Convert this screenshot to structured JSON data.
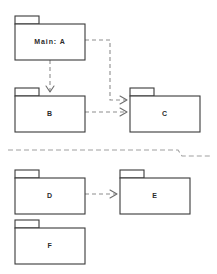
{
  "diagram": {
    "kind": "uml-package-diagram",
    "canvas": {
      "width": 217,
      "height": 274,
      "background": "#ffffff"
    },
    "colors": {
      "package_border": "#3a3a3a",
      "package_fill": "#ffffff",
      "label_text": "#2b2b2b",
      "dependency_line": "#8e8e8e",
      "arrow_head": "#6e6e6e",
      "separator_line": "#a0a0a0"
    },
    "packages": [
      {
        "id": "A",
        "label": "Main: A",
        "x": 15,
        "y": 24,
        "width": 70,
        "height": 36,
        "tab": {
          "x": 15,
          "y": 16,
          "width": 24,
          "height": 8
        },
        "label_x": 50,
        "label_y": 42
      },
      {
        "id": "B",
        "label": "B",
        "x": 15,
        "y": 96,
        "width": 70,
        "height": 36,
        "tab": {
          "x": 15,
          "y": 88,
          "width": 24,
          "height": 8
        },
        "label_x": 50,
        "label_y": 114
      },
      {
        "id": "C",
        "label": "C",
        "x": 130,
        "y": 96,
        "width": 70,
        "height": 36,
        "tab": {
          "x": 130,
          "y": 88,
          "width": 24,
          "height": 8
        },
        "label_x": 165,
        "label_y": 114
      },
      {
        "id": "D",
        "label": "D",
        "x": 15,
        "y": 178,
        "width": 70,
        "height": 36,
        "tab": {
          "x": 15,
          "y": 170,
          "width": 24,
          "height": 8
        },
        "label_x": 50,
        "label_y": 196
      },
      {
        "id": "E",
        "label": "E",
        "x": 120,
        "y": 178,
        "width": 70,
        "height": 36,
        "tab": {
          "x": 120,
          "y": 170,
          "width": 24,
          "height": 8
        },
        "label_x": 155,
        "label_y": 196
      },
      {
        "id": "F",
        "label": "F",
        "x": 15,
        "y": 228,
        "width": 70,
        "height": 36,
        "tab": {
          "x": 15,
          "y": 220,
          "width": 24,
          "height": 8
        },
        "label_x": 50,
        "label_y": 246
      }
    ],
    "dependencies": [
      {
        "id": "a-to-b",
        "from": "A",
        "to": "B",
        "style": "dashed",
        "path": "M 50 60 L 50 92",
        "arrow": "M 46 86 L 50 92 L 54 86"
      },
      {
        "id": "a-to-c",
        "from": "A",
        "to": "C",
        "style": "dashed",
        "path": "M 85 40 L 110 40 L 110 100 L 126 100",
        "arrow": "M 120 96 L 127 100 L 120 104"
      },
      {
        "id": "b-to-c",
        "from": "B",
        "to": "C",
        "style": "dashed",
        "path": "M 85 112 L 126 112",
        "arrow": "M 120 108 L 127 112 L 120 116"
      },
      {
        "id": "d-to-e",
        "from": "D",
        "to": "E",
        "style": "dashed",
        "path": "M 85 194 L 116 194",
        "arrow": "M 110 190 L 117 194 L 110 198"
      }
    ],
    "separators": [
      {
        "id": "horizontal-separator",
        "style": "dashed",
        "path": "M 8 150 L 178 150 L 182 156 L 210 156"
      }
    ]
  }
}
